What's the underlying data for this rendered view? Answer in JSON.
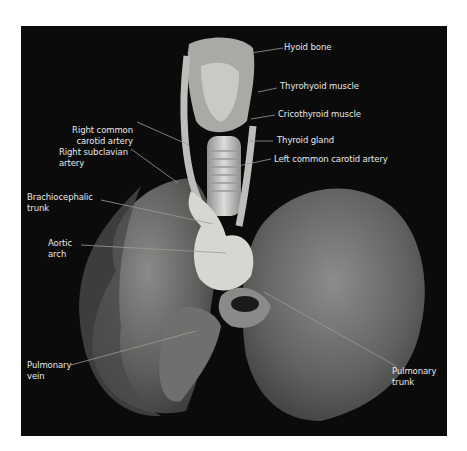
{
  "figure": {
    "labels": {
      "hyoid_bone": "Hyoid bone",
      "thyrohyoid_muscle": "Thyrohyoid muscle",
      "cricothyroid_muscle": "Cricothyroid muscle",
      "thyroid_gland": "Thyroid gland",
      "left_common_carotid_artery": "Left common carotid artery",
      "right_common_carotid_artery": "Right common\ncarotid artery",
      "right_subclavian_artery": "Right subclavian\nartery",
      "brachiocephalic_trunk": "Brachiocephalic\ntrunk",
      "aortic_arch": "Aortic\narch",
      "pulmonary_vein": "Pulmonary\nvein",
      "pulmonary_trunk": "Pulmonary\ntrunk"
    },
    "colors": {
      "background": "#0b0b0b",
      "label_text": "#e8e8e8",
      "leader_line": "#9a9a9a"
    }
  }
}
